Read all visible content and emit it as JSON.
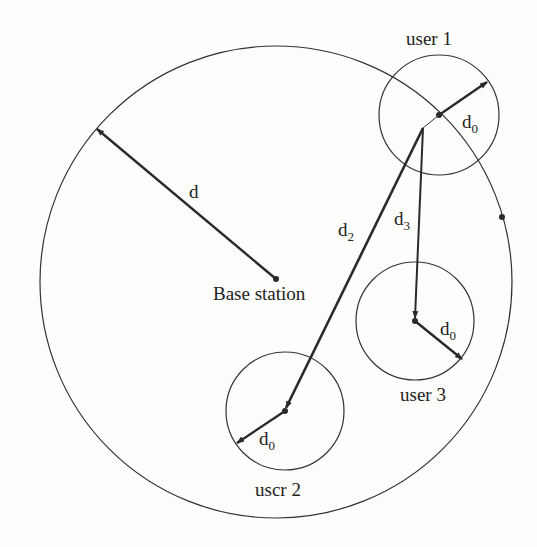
{
  "diagram": {
    "type": "cell coverage diagram",
    "cell_radius_label": "d",
    "base_station": {
      "label": "Base station",
      "x": 276,
      "y": 279
    },
    "users": [
      {
        "label": "user 1",
        "radius_label": "d",
        "radius_sub": "0",
        "x": 439,
        "y": 115,
        "r": 60
      },
      {
        "label": "user 3",
        "radius_label": "d",
        "radius_sub": "0",
        "x": 415,
        "y": 321,
        "r": 59
      },
      {
        "label": "uscr 2",
        "radius_label": "d",
        "radius_sub": "0",
        "x": 285,
        "y": 411,
        "r": 59
      }
    ],
    "distances": [
      {
        "label": "d",
        "sub": "2"
      },
      {
        "label": "d",
        "sub": "3"
      }
    ],
    "colors": {
      "line": "#2a2a2a",
      "background": "#fdfdfb"
    }
  }
}
